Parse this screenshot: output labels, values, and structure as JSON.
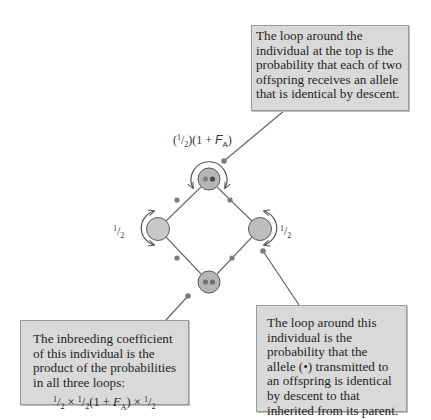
{
  "diagram": {
    "type": "pedigree-loop-diagram",
    "colors": {
      "note_bg": "#d9d9d9",
      "note_border": "#9a9a9a",
      "node_fill_light": "#c8c8c8",
      "node_fill_dark": "#b5b5b5",
      "node_stroke": "#5a5a5a",
      "edge_color": "#6a6a6a",
      "dot_color": "#7a7a7a",
      "allele_color": "#6f6f6f"
    },
    "nodes": [
      {
        "id": "common-ancestor-A",
        "position": "top",
        "x": 209,
        "y": 179,
        "alleles_shown": 2
      },
      {
        "id": "left-parent",
        "position": "left",
        "x": 158,
        "y": 229,
        "alleles_shown": 0
      },
      {
        "id": "right-parent",
        "position": "right",
        "x": 260,
        "y": 229,
        "alleles_shown": 0
      },
      {
        "id": "inbred-individual",
        "position": "bottom",
        "x": 209,
        "y": 282,
        "alleles_shown": 2
      }
    ],
    "labels": {
      "top_loop": {
        "prefix_open": "(",
        "num": "1",
        "den": "2",
        "middle": ")(1 + ",
        "F": "F",
        "sub": "A",
        "suffix": ")"
      },
      "left_loop": {
        "num": "1",
        "den": "2"
      },
      "right_loop": {
        "num": "1",
        "den": "2"
      }
    },
    "notes": {
      "top": {
        "lines": [
          "The loop around the",
          "individual at the top is the",
          "probability that each of two",
          "offspring receives an allele",
          "that is identical by descent."
        ]
      },
      "left": {
        "lines": [
          "The inbreeding coefficient",
          "of this individual is the",
          "product of the probabilities",
          "in all three loops:"
        ],
        "formula": {
          "a_num": "1",
          "a_den": "2",
          "times1": " × ",
          "b_num": "1",
          "b_den": "2",
          "open": "(1 + ",
          "F": "F",
          "sub": "A",
          "close": ")",
          "times2": " × ",
          "c_num": "1",
          "c_den": "2"
        }
      },
      "right": {
        "lines": [
          "The loop around this",
          "individual is the",
          "probability that the",
          "allele (•) transmitted to",
          "an offspring is identical",
          "by descent to that",
          "inherited from its parent."
        ]
      }
    }
  }
}
